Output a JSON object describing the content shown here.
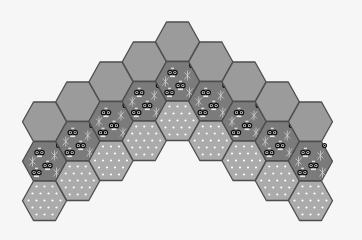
{
  "board": {
    "layout": "flat-top hex arch",
    "hex_width": 44,
    "hex_height": 39.5,
    "column_spacing": 33.25,
    "origin_center_x": 177.5,
    "top_hex_top_y": 22,
    "column_offset_y": 20,
    "colors": {
      "background": "#f6f6f6",
      "stone": "#9b9b9b",
      "water": "#7b7b7b",
      "sand": "#ababab",
      "outline": "#4e4e4e",
      "dot": "#ffffff"
    },
    "columns": [
      {
        "index": -4,
        "tiles": [
          "stone",
          "water",
          "sand"
        ]
      },
      {
        "index": -3,
        "tiles": [
          "stone",
          "water",
          "sand"
        ]
      },
      {
        "index": -2,
        "tiles": [
          "stone",
          "water",
          "sand"
        ]
      },
      {
        "index": -1,
        "tiles": [
          "stone",
          "water",
          "sand"
        ]
      },
      {
        "index": 0,
        "tiles": [
          "stone",
          "water",
          "sand"
        ]
      },
      {
        "index": 1,
        "tiles": [
          "stone",
          "water",
          "sand"
        ]
      },
      {
        "index": 2,
        "tiles": [
          "stone",
          "water",
          "sand"
        ]
      },
      {
        "index": 3,
        "tiles": [
          "stone",
          "water",
          "sand"
        ]
      },
      {
        "index": 4,
        "tiles": [
          "stone",
          "water",
          "sand"
        ]
      }
    ],
    "tile_types": {
      "stone": {
        "label": "plain gray tile",
        "icon": "none"
      },
      "water": {
        "label": "dark tile with creatures and plants",
        "icon": "fish-eyes-icon"
      },
      "sand": {
        "label": "dotted tile",
        "icon": "dots-pattern"
      }
    }
  }
}
